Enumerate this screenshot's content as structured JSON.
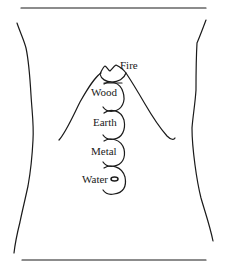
{
  "diagram": {
    "type": "anatomical torso outline with five stacked element circles",
    "elements": [
      {
        "id": "fire",
        "label": "Fire"
      },
      {
        "id": "wood",
        "label": "Wood"
      },
      {
        "id": "earth",
        "label": "Earth"
      },
      {
        "id": "metal",
        "label": "Metal"
      },
      {
        "id": "water",
        "label": "Water"
      }
    ],
    "colors": {
      "stroke": "#1a1a1a",
      "background": "#ffffff"
    }
  }
}
